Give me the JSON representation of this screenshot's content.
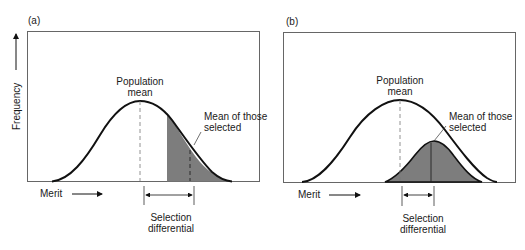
{
  "panels": [
    {
      "tag": "(a)",
      "ylabel": "Frequency",
      "xlabel": "Merit",
      "population_mean_label": [
        "Population",
        "mean"
      ],
      "selected_mean_label": [
        "Mean of those",
        "selected"
      ],
      "selection_differential_label": [
        "Selection",
        "differential"
      ]
    },
    {
      "tag": "(b)",
      "xlabel": "Merit",
      "population_mean_label": [
        "Population",
        "mean"
      ],
      "selected_mean_label": [
        "Mean of those",
        "selected"
      ],
      "selection_differential_label": [
        "Selection",
        "differential"
      ]
    }
  ],
  "colors": {
    "line": "#111111",
    "shade": "#7a7a7a",
    "frame": "#555555"
  }
}
